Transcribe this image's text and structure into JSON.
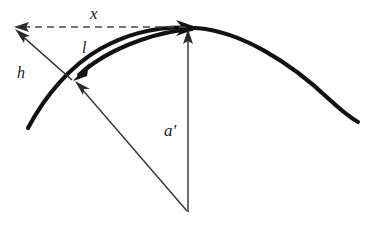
{
  "figure": {
    "background_color": "#ffffff",
    "width": 368,
    "height": 228,
    "labels": {
      "x": "x",
      "l": "l",
      "h": "h",
      "a_prime": "a'"
    },
    "elements": {
      "curve_name": "trajectory-arc",
      "apex_name": "apex-point",
      "point_name": "launch-reference-point",
      "vertex_name": "origin-vertex"
    },
    "colors": {
      "curve": "#111111",
      "thin_line": "#3a3a3a",
      "dashed": "#4a4a4a",
      "label": "#1a1a1a"
    },
    "geometry": {
      "apex": [
        196,
        28
      ],
      "chord_point": [
        73,
        80
      ],
      "vertex": [
        188,
        212
      ],
      "x_arrow_tip": [
        15,
        27
      ],
      "h_arrow_tip": [
        15,
        30
      ],
      "curve_left_end": [
        28,
        128
      ],
      "curve_right_end": [
        358,
        122
      ]
    }
  }
}
